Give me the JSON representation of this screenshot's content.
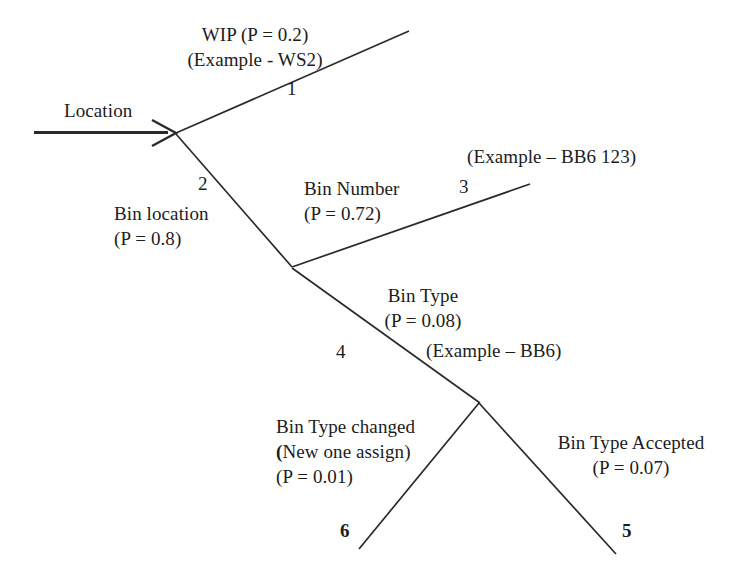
{
  "diagram": {
    "type": "probability-decision-tree",
    "root": {
      "label": "Location",
      "name": "root-arrow-label"
    },
    "nodes": [
      {
        "id": "node-1",
        "branch_number": "1",
        "label_lines": [
          "WIP (P = 0.2)",
          "(Example - WS2)"
        ],
        "probability": 0.2,
        "outcome": "WIP",
        "example": "WS2"
      },
      {
        "id": "node-2",
        "branch_number": "2",
        "label_lines": [
          "Bin location",
          "(P = 0.8)"
        ],
        "probability": 0.8,
        "outcome": "Bin location",
        "example": ""
      },
      {
        "id": "node-3",
        "branch_number": "3",
        "label_lines": [
          "Bin Number",
          "(P = 0.72)"
        ],
        "probability": 0.72,
        "outcome": "Bin Number",
        "example": "(Example – BB6 123)"
      },
      {
        "id": "node-4",
        "branch_number": "4",
        "label_lines": [
          "Bin Type",
          "(P = 0.08)"
        ],
        "probability": 0.08,
        "outcome": "Bin Type",
        "example": "(Example – BB6)"
      },
      {
        "id": "node-5",
        "branch_number": "5",
        "label_lines": [
          "Bin Type Accepted",
          "(P = 0.07)"
        ],
        "probability": 0.07,
        "outcome": "Bin Type Accepted",
        "example": ""
      },
      {
        "id": "node-6",
        "branch_number": "6",
        "label_lines": [
          "Bin Type changed",
          "(New one assign)",
          "(P = 0.01)"
        ],
        "probability": 0.01,
        "outcome": "Bin Type changed (New one assign)",
        "example": ""
      }
    ]
  },
  "labels": {
    "location": "Location",
    "wip_line1": "WIP (P = 0.2)",
    "wip_line2": "(Example - WS2)",
    "num_1": "1",
    "num_2": "2",
    "binlocation_line1": "Bin location",
    "binlocation_line2": "(P = 0.8)",
    "binnumber_line1": "Bin Number",
    "binnumber_line2": "(P = 0.72)",
    "num_3": "3",
    "example_bb6_123": "(Example – BB6 123)",
    "bintype_line1": "Bin Type",
    "bintype_line2": "(P = 0.08)",
    "num_4": "4",
    "example_bb6": "(Example – BB6)",
    "bintypechanged_line1": "Bin Type changed",
    "bintypechanged_line2_open": "(",
    "bintypechanged_line2_rest": "New one assign)",
    "bintypechanged_line3": "(P = 0.01)",
    "num_6": "6",
    "bintypeaccepted_line1": "Bin Type Accepted",
    "bintypeaccepted_line2": "(P = 0.07)",
    "num_5": "5"
  },
  "style": {
    "stroke": "#2a2a2a",
    "background": "#ffffff",
    "text_color": "#1c1c1c"
  }
}
